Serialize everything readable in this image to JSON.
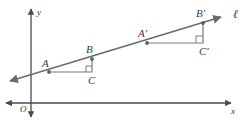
{
  "figure": {
    "kind": "coordinate-geometry-diagram",
    "colors": {
      "axis": "#4a4a4a",
      "line": "#6b6b6b",
      "triangle": "#7a7a7a",
      "label": "#3b3b3b",
      "background": "#ffffff"
    },
    "axes": {
      "x_label": "x",
      "y_label": "y",
      "origin_label": "O"
    },
    "line": {
      "label": "ℓ",
      "start": [
        10,
        81
      ],
      "end": [
        222,
        17
      ]
    },
    "points": [
      {
        "id": "A",
        "label": "A",
        "x": 49,
        "y": 72,
        "label_x": 42,
        "label_y": 58,
        "dot": true
      },
      {
        "id": "B",
        "label": "B",
        "x": 92,
        "y": 59,
        "label_x": 86,
        "label_y": 44,
        "dot": true
      },
      {
        "id": "C",
        "label": "C",
        "x": 92,
        "y": 72,
        "label_x": 88,
        "label_y": 75,
        "dot": false
      },
      {
        "id": "Ap",
        "label": "A′",
        "x": 147,
        "y": 43,
        "label_x": 138,
        "label_y": 28,
        "dot": true
      },
      {
        "id": "Bp",
        "label": "B′",
        "x": 203,
        "y": 23,
        "label_x": 196,
        "label_y": 8,
        "dot": true
      },
      {
        "id": "Cp",
        "label": "C′",
        "x": 203,
        "y": 43,
        "label_x": 199,
        "label_y": 46,
        "dot": false
      }
    ],
    "triangles": [
      {
        "id": "ABC",
        "vertices": [
          "A",
          "B",
          "C"
        ],
        "right_angle_at": "C"
      },
      {
        "id": "ApBpCp",
        "vertices": [
          "Ap",
          "Bp",
          "Cp"
        ],
        "right_angle_at": "Cp"
      }
    ]
  }
}
